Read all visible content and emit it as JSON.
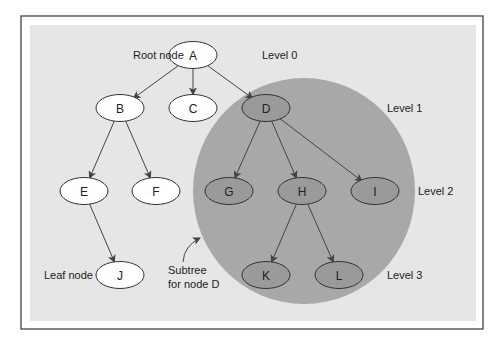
{
  "diagram": {
    "colors": {
      "frame": "#333333",
      "panel": "#e6e6e6",
      "subtree": "#a8a8a8",
      "node_fill": "#ffffff",
      "subtree_node_fill": "#9a9a9a",
      "edge": "#444444"
    },
    "nodes": [
      {
        "id": "A",
        "label": "A",
        "x": 193,
        "y": 55,
        "in_subtree": false
      },
      {
        "id": "B",
        "label": "B",
        "x": 120,
        "y": 108,
        "in_subtree": false
      },
      {
        "id": "C",
        "label": "C",
        "x": 193,
        "y": 108,
        "in_subtree": false
      },
      {
        "id": "D",
        "label": "D",
        "x": 266,
        "y": 108,
        "in_subtree": true
      },
      {
        "id": "E",
        "label": "E",
        "x": 84,
        "y": 191,
        "in_subtree": false
      },
      {
        "id": "F",
        "label": "F",
        "x": 156,
        "y": 191,
        "in_subtree": false
      },
      {
        "id": "G",
        "label": "G",
        "x": 229,
        "y": 191,
        "in_subtree": true
      },
      {
        "id": "H",
        "label": "H",
        "x": 302,
        "y": 191,
        "in_subtree": true
      },
      {
        "id": "I",
        "label": "I",
        "x": 375,
        "y": 191,
        "in_subtree": true
      },
      {
        "id": "J",
        "label": "J",
        "x": 120,
        "y": 275,
        "in_subtree": false
      },
      {
        "id": "K",
        "label": "K",
        "x": 266,
        "y": 275,
        "in_subtree": true
      },
      {
        "id": "L",
        "label": "L",
        "x": 339,
        "y": 275,
        "in_subtree": true
      }
    ],
    "edges": [
      [
        "A",
        "B"
      ],
      [
        "A",
        "C"
      ],
      [
        "A",
        "D"
      ],
      [
        "B",
        "E"
      ],
      [
        "B",
        "F"
      ],
      [
        "D",
        "G"
      ],
      [
        "D",
        "H"
      ],
      [
        "D",
        "I"
      ],
      [
        "E",
        "J"
      ],
      [
        "H",
        "K"
      ],
      [
        "H",
        "L"
      ]
    ],
    "annotations": {
      "root_node": "Root node",
      "leaf_node": "Leaf node",
      "subtree_line1": "Subtree",
      "subtree_line2": "for node D"
    },
    "levels": [
      {
        "label": "Level 0",
        "x": 262,
        "y": 59
      },
      {
        "label": "Level 1",
        "x": 387,
        "y": 112
      },
      {
        "label": "Level 2",
        "x": 418,
        "y": 195
      },
      {
        "label": "Level 3",
        "x": 387,
        "y": 279
      }
    ]
  }
}
